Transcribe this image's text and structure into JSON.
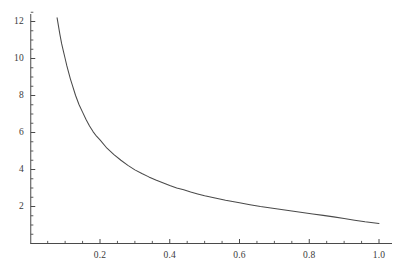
{
  "chart_data": {
    "type": "line",
    "title": "",
    "subtitle": "",
    "xlabel": "",
    "ylabel": "",
    "xlim": [
      0.0,
      1.045
    ],
    "ylim": [
      0.0,
      12.8
    ],
    "grid": false,
    "legend": null,
    "line_color": "#4a4a4a",
    "axis_color": "#4a4a4a",
    "background": "#ffffff",
    "x_ticks": [
      0.2,
      0.4,
      0.6,
      0.8,
      1.0
    ],
    "x_tick_labels": [
      "0.2",
      "0.4",
      "0.6",
      "0.8",
      "1.0"
    ],
    "x_minor_ticks": [
      0.05,
      0.1,
      0.15,
      0.25,
      0.3,
      0.35,
      0.45,
      0.5,
      0.55,
      0.65,
      0.7,
      0.75,
      0.85,
      0.9,
      0.95
    ],
    "y_ticks": [
      2,
      4,
      6,
      8,
      10,
      12
    ],
    "y_tick_labels": [
      "2",
      "4",
      "6",
      "8",
      "10",
      "12"
    ],
    "y_minor_ticks": [
      0.5,
      1,
      1.5,
      2.5,
      3,
      3.5,
      4.5,
      5,
      5.5,
      6.5,
      7,
      7.5,
      8.5,
      9,
      9.5,
      10.5,
      11,
      11.5,
      12.5
    ],
    "series": [
      {
        "name": "curve",
        "x": [
          0.077,
          0.085,
          0.09,
          0.095,
          0.1,
          0.105,
          0.11,
          0.115,
          0.12,
          0.13,
          0.14,
          0.15,
          0.16,
          0.17,
          0.18,
          0.19,
          0.2,
          0.22,
          0.24,
          0.26,
          0.28,
          0.3,
          0.32,
          0.34,
          0.36,
          0.38,
          0.4,
          0.42,
          0.44,
          0.46,
          0.48,
          0.5,
          0.52,
          0.54,
          0.56,
          0.58,
          0.6,
          0.63,
          0.66,
          0.69,
          0.72,
          0.75,
          0.78,
          0.81,
          0.84,
          0.87,
          0.9,
          0.93,
          0.96,
          1.0
        ],
        "y": [
          12.2,
          11.3,
          10.8,
          10.4,
          10.0,
          9.6,
          9.25,
          8.9,
          8.6,
          8.0,
          7.5,
          7.1,
          6.7,
          6.35,
          6.05,
          5.8,
          5.6,
          5.15,
          4.8,
          4.5,
          4.22,
          3.98,
          3.78,
          3.6,
          3.43,
          3.28,
          3.13,
          3.0,
          2.9,
          2.78,
          2.68,
          2.58,
          2.5,
          2.42,
          2.34,
          2.27,
          2.2,
          2.1,
          2.0,
          1.92,
          1.84,
          1.76,
          1.68,
          1.6,
          1.52,
          1.44,
          1.35,
          1.26,
          1.17,
          1.08
        ]
      }
    ]
  },
  "figure": {
    "width": 398,
    "height": 271
  }
}
